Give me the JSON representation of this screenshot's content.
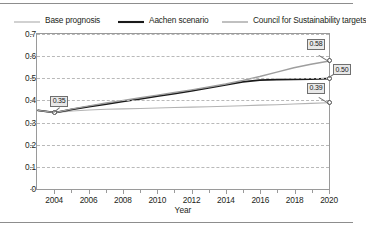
{
  "chart_data": {
    "type": "line",
    "title": "",
    "xlabel": "Year",
    "ylabel": "",
    "xlim": [
      2003,
      2020
    ],
    "ylim": [
      0,
      0.7
    ],
    "grid": true,
    "legend_position": "top",
    "x": [
      2003,
      2004,
      2005,
      2006,
      2007,
      2008,
      2009,
      2010,
      2011,
      2012,
      2013,
      2014,
      2015,
      2016,
      2017,
      2018,
      2019,
      2020
    ],
    "y_ticks": [
      "0",
      "0.1",
      "0.2",
      "0.3",
      "0.4",
      "0.5",
      "0.6",
      "0.7"
    ],
    "y_tick_values": [
      0,
      0.1,
      0.2,
      0.3,
      0.4,
      0.5,
      0.6,
      0.7
    ],
    "x_ticks": [
      "2004",
      "2006",
      "2008",
      "2010",
      "2012",
      "2014",
      "2016",
      "2018",
      "2020"
    ],
    "x_tick_values": [
      2004,
      2006,
      2008,
      2010,
      2012,
      2014,
      2016,
      2018,
      2020
    ],
    "series": [
      {
        "name": "Base prognosis",
        "color": "#b3b3b3",
        "width": 1.1,
        "values": [
          0.355,
          0.345,
          0.352,
          0.357,
          0.36,
          0.362,
          0.364,
          0.366,
          0.368,
          0.37,
          0.372,
          0.374,
          0.376,
          0.379,
          0.381,
          0.384,
          0.387,
          0.39
        ]
      },
      {
        "name": "Aachen scenario",
        "color": "#1a1a1a",
        "width": 1.8,
        "values": [
          0.355,
          0.345,
          0.36,
          0.372,
          0.384,
          0.396,
          0.408,
          0.42,
          0.432,
          0.444,
          0.458,
          0.472,
          0.486,
          0.494,
          0.496,
          0.497,
          0.498,
          0.5
        ]
      },
      {
        "name": "Council for Sustainability targets",
        "color": "#9e9e9e",
        "width": 1.4,
        "values": [
          0.355,
          0.345,
          0.362,
          0.376,
          0.389,
          0.401,
          0.413,
          0.425,
          0.437,
          0.449,
          0.462,
          0.476,
          0.492,
          0.51,
          0.53,
          0.55,
          0.566,
          0.58
        ]
      }
    ],
    "annotations": [
      {
        "label": "0.35",
        "x": 2004,
        "y": 0.345,
        "anchor": "start"
      },
      {
        "label": "0.58",
        "x": 2020,
        "y": 0.58,
        "series": "Council for Sustainability targets"
      },
      {
        "label": "0.50",
        "x": 2020,
        "y": 0.5,
        "series": "Aachen scenario"
      },
      {
        "label": "0.39",
        "x": 2020,
        "y": 0.39,
        "series": "Base prognosis"
      }
    ]
  },
  "legend": {
    "items": [
      {
        "label": "Base prognosis",
        "color": "#b3b3b3"
      },
      {
        "label": "Aachen scenario",
        "color": "#1a1a1a"
      },
      {
        "label": "Council for Sustainability targets",
        "color": "#9e9e9e"
      }
    ]
  },
  "axes": {
    "x_title": "Year"
  }
}
